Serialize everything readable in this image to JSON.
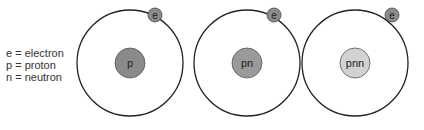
{
  "legend": {
    "items": [
      "e = electron",
      "p = proton",
      "n = neutron"
    ]
  },
  "atoms": [
    {
      "name": "hydrogen",
      "nucleus_label": "p",
      "electron_label": "e",
      "nucleus_color": "#8a8a8a"
    },
    {
      "name": "deuterium",
      "nucleus_label": "pn",
      "electron_label": "e",
      "nucleus_color": "#9a9a9a"
    },
    {
      "name": "tritium",
      "nucleus_label": "pnn",
      "electron_label": "e",
      "nucleus_color": "#d2d2d2"
    }
  ],
  "colors": {
    "orbit": "#222222",
    "electron": "#8c8c8c"
  }
}
